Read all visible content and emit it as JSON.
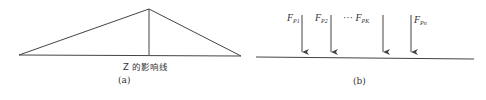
{
  "panel_a": {
    "label": "(a)",
    "influence_line_label": "Z 的影响线",
    "shape": {
      "left_base": [
        19,
        55
      ],
      "apex": [
        149,
        9
      ],
      "right_base": [
        241,
        56
      ],
      "vertical_ordinate_x": 149
    }
  },
  "panel_b": {
    "label": "(b)",
    "beam": {
      "x1": 256,
      "x2": 474,
      "y": 58
    },
    "forces": [
      {
        "symbol": "F",
        "subscript": "P1",
        "prefix": "",
        "arrow_x": 302
      },
      {
        "symbol": "F",
        "subscript": "P2",
        "prefix": "",
        "arrow_x": 331
      },
      {
        "symbol": "F",
        "subscript": "PK",
        "prefix": "··· ",
        "arrow_x": 383
      },
      {
        "symbol": "F",
        "subscript": "Pn",
        "prefix": "",
        "arrow_x": 411
      }
    ]
  },
  "colors": {
    "line": "#444444",
    "text": "#333333",
    "background": "#ffffff"
  }
}
